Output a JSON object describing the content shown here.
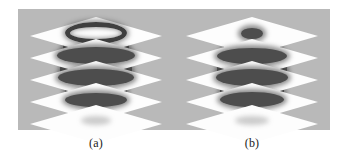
{
  "figure": {
    "background_color": "#b9b9b9",
    "page_color": "#ffffff",
    "plane_color": "#fdfdfd",
    "object_color": "#4d4d4d",
    "caption_color": "#1b1b1b"
  },
  "panels": [
    {
      "label": "(a)",
      "name": "panel-a",
      "description": "stacked axial slice planes through a reconstructed volume, tapered barrel shape",
      "num_planes": 5,
      "slices": [
        {
          "index": 1,
          "cross_section": "ring",
          "width": 62,
          "height": 20,
          "note": "open annulus, bright center"
        },
        {
          "index": 2,
          "cross_section": "filled",
          "width": 78,
          "height": 17,
          "note": "wide dark band"
        },
        {
          "index": 3,
          "cross_section": "filled",
          "width": 76,
          "height": 17,
          "note": "wide dark band"
        },
        {
          "index": 4,
          "cross_section": "filled",
          "width": 62,
          "height": 14,
          "note": "narrowing dark band"
        },
        {
          "index": 5,
          "cross_section": "shadow",
          "width": 30,
          "height": 9,
          "note": "empty plane, faint shadow only"
        }
      ],
      "body_segments": [
        {
          "index": 1,
          "width": 66,
          "height": 22
        },
        {
          "index": 2,
          "width": 72,
          "height": 22
        },
        {
          "index": 3,
          "width": 62,
          "height": 20
        }
      ]
    },
    {
      "label": "(b)",
      "name": "panel-b",
      "description": "stacked axial slice planes through a reconstructed volume, compact spheroid shape",
      "num_planes": 5,
      "slices": [
        {
          "index": 1,
          "cross_section": "filled",
          "width": 22,
          "height": 11,
          "note": "small dark blob near center"
        },
        {
          "index": 2,
          "cross_section": "filled",
          "width": 70,
          "height": 16,
          "note": "wide dark band"
        },
        {
          "index": 3,
          "cross_section": "filled",
          "width": 72,
          "height": 17,
          "note": "widest dark band"
        },
        {
          "index": 4,
          "cross_section": "filled",
          "width": 64,
          "height": 15,
          "note": "dark band"
        },
        {
          "index": 5,
          "cross_section": "shadow",
          "width": 34,
          "height": 9,
          "note": "empty plane, faint shadow only"
        }
      ],
      "body_segments": [
        {
          "index": 1,
          "width": 58,
          "height": 22
        },
        {
          "index": 2,
          "width": 70,
          "height": 22
        },
        {
          "index": 3,
          "width": 64,
          "height": 20
        }
      ]
    }
  ]
}
